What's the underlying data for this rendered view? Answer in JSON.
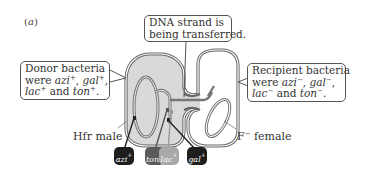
{
  "panel_label": {
    "open": "(",
    "letter": "a",
    "close": ")"
  },
  "callouts": {
    "dna": {
      "line1": "DNA strand is",
      "line2": "being transferred."
    },
    "donor": {
      "line1": "Donor bacteria",
      "line2_prefix": "were ",
      "genes": [
        "azi",
        "gal",
        "lac",
        "ton"
      ],
      "sign": "+",
      "sep1": ", ",
      "sep2": ",",
      "and": " and ",
      "end": "."
    },
    "recipient": {
      "line1": "Recipient bacteria",
      "line2_prefix": "were ",
      "genes": [
        "azi",
        "gal",
        "lac",
        "ton"
      ],
      "sign": "−",
      "sep1": ", ",
      "sep2": ",",
      "and": " and ",
      "end": "."
    }
  },
  "cells": {
    "male": {
      "label": "Hfr male"
    },
    "female": {
      "label_prefix": "F",
      "label_sign": "−",
      "label_suffix": " female"
    }
  },
  "gene_markers": [
    {
      "name": "azi",
      "sign": "+",
      "color": "#1e1e1e"
    },
    {
      "name": "ton",
      "sign": "+",
      "color": "#5a5a5a"
    },
    {
      "name": "lac",
      "sign": "+",
      "color": "#a8a8a8"
    },
    {
      "name": "gal",
      "sign": "+",
      "color": "#1e1e1e"
    }
  ],
  "colors": {
    "cell_outline": "#666666",
    "male_fill": "#d9d9d9",
    "female_fill": "#ffffff",
    "dna_strand": "#777777"
  }
}
